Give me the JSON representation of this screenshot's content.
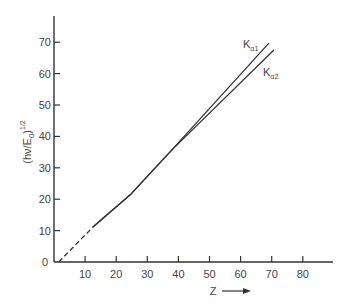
{
  "chart_data": {
    "type": "line",
    "title": "",
    "xlabel": "Z",
    "xlabel_arrow": "→",
    "ylabel": "(hν/E0)^1/2",
    "ylabel_parts": {
      "main": "(hν/E",
      "sub": "0",
      "close": ")",
      "sup": "1/2"
    },
    "xlim": [
      0,
      90
    ],
    "ylim": [
      0,
      78
    ],
    "x_ticks": [
      0,
      10,
      20,
      30,
      40,
      50,
      60,
      70,
      80
    ],
    "x_tick_labels": [
      "10",
      "20",
      "30",
      "40",
      "50",
      "60",
      "70",
      "80"
    ],
    "y_ticks": [
      0,
      10,
      20,
      30,
      40,
      50,
      60,
      70
    ],
    "y_tick_labels": [
      "0",
      "10",
      "20",
      "30",
      "40",
      "50",
      "60",
      "70"
    ],
    "grid": false,
    "legend": "inline labels at line ends",
    "series": [
      {
        "name": "Kα1",
        "label_main": "K",
        "label_sub": "α1",
        "style": "solid",
        "points": [
          [
            12.5,
            11.1
          ],
          [
            24.8,
            21.7
          ],
          [
            37.9,
            35.7
          ],
          [
            69.1,
            69.7
          ]
        ]
      },
      {
        "name": "Kα2",
        "label_main": "K",
        "label_sub": "α2",
        "style": "solid",
        "points": [
          [
            12.5,
            11.1
          ],
          [
            24.8,
            21.7
          ],
          [
            37.9,
            35.7
          ],
          [
            70.7,
            67.5
          ]
        ]
      },
      {
        "name": "extrapolation",
        "style": "dashed",
        "points": [
          [
            1.5,
            0
          ],
          [
            12.5,
            11.1
          ]
        ]
      }
    ]
  }
}
